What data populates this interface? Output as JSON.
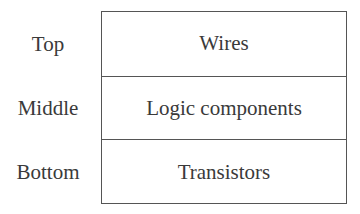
{
  "diagram": {
    "levels": [
      {
        "position": "Top",
        "content": "Wires"
      },
      {
        "position": "Middle",
        "content": "Logic components"
      },
      {
        "position": "Bottom",
        "content": "Transistors"
      }
    ]
  }
}
